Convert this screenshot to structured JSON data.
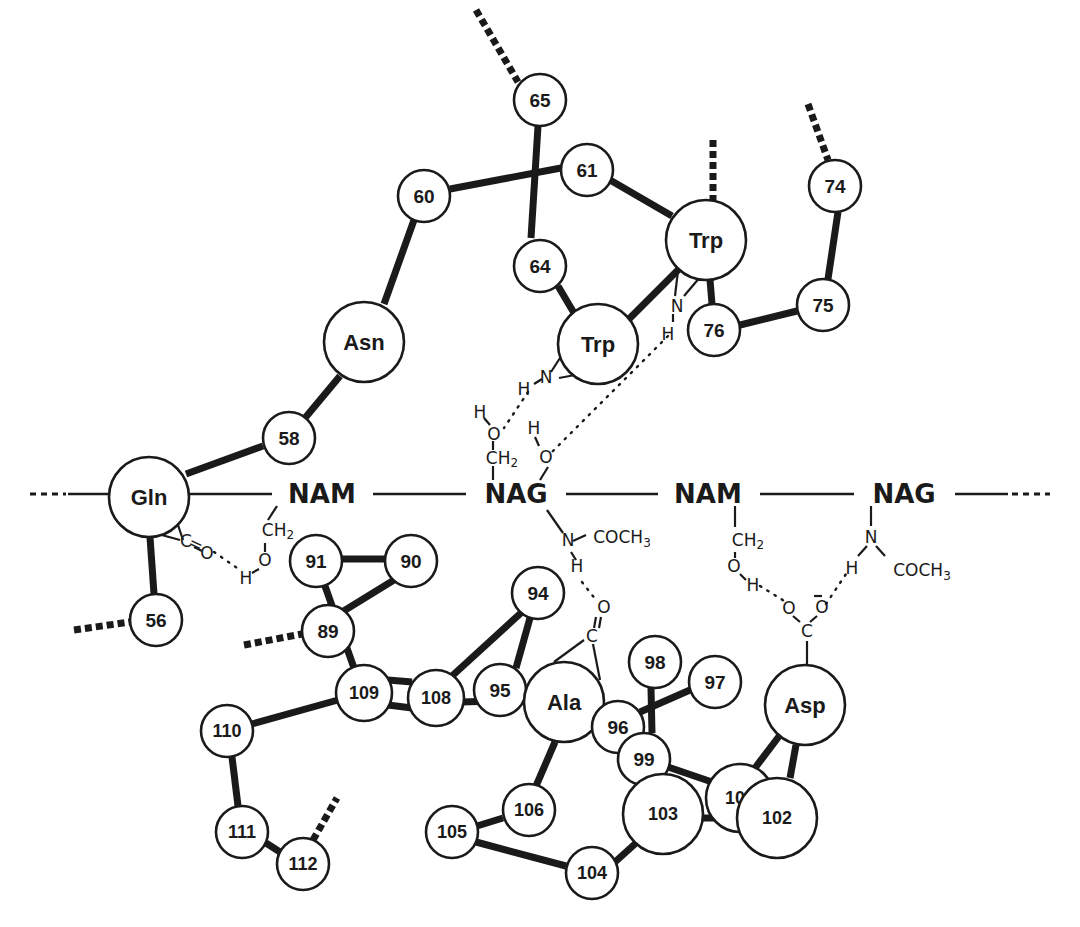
{
  "diagram": {
    "colors": {
      "ink": "#1a1a1a",
      "background": "#ffffff"
    },
    "backbone_chain": {
      "sugars": [
        {
          "id": "nam1",
          "label": "NAM",
          "x": 322,
          "y": 494
        },
        {
          "id": "nag1",
          "label": "NAG",
          "x": 516,
          "y": 494
        },
        {
          "id": "nam2",
          "label": "NAM",
          "x": 708,
          "y": 494
        },
        {
          "id": "nag2",
          "label": "NAG",
          "x": 904,
          "y": 494
        }
      ],
      "left_continuation": "...",
      "right_continuation": "..."
    },
    "residues": [
      {
        "id": "r65",
        "label": "65",
        "x": 540,
        "y": 100,
        "r": 26
      },
      {
        "id": "r61",
        "label": "61",
        "x": 587,
        "y": 170,
        "r": 26
      },
      {
        "id": "r60",
        "label": "60",
        "x": 424,
        "y": 196,
        "r": 26
      },
      {
        "id": "r64",
        "label": "64",
        "x": 540,
        "y": 266,
        "r": 26
      },
      {
        "id": "trp63",
        "label": "Trp",
        "x": 706,
        "y": 240,
        "r": 40
      },
      {
        "id": "trp62",
        "label": "Trp",
        "x": 598,
        "y": 344,
        "r": 40
      },
      {
        "id": "r76",
        "label": "76",
        "x": 714,
        "y": 330,
        "r": 26
      },
      {
        "id": "r75",
        "label": "75",
        "x": 823,
        "y": 305,
        "r": 26
      },
      {
        "id": "r74",
        "label": "74",
        "x": 835,
        "y": 186,
        "r": 26
      },
      {
        "id": "asn59",
        "label": "Asn",
        "x": 364,
        "y": 342,
        "r": 40
      },
      {
        "id": "r58",
        "label": "58",
        "x": 289,
        "y": 438,
        "r": 26
      },
      {
        "id": "gln57",
        "label": "Gln",
        "x": 149,
        "y": 497,
        "r": 40
      },
      {
        "id": "r56",
        "label": "56",
        "x": 156,
        "y": 620,
        "r": 26
      },
      {
        "id": "r91",
        "label": "91",
        "x": 316,
        "y": 561,
        "r": 26
      },
      {
        "id": "r90",
        "label": "90",
        "x": 411,
        "y": 561,
        "r": 26
      },
      {
        "id": "r89",
        "label": "89",
        "x": 328,
        "y": 631,
        "r": 26
      },
      {
        "id": "r109",
        "label": "109",
        "x": 364,
        "y": 693,
        "r": 28
      },
      {
        "id": "r108",
        "label": "108",
        "x": 436,
        "y": 698,
        "r": 28
      },
      {
        "id": "r95",
        "label": "95",
        "x": 500,
        "y": 690,
        "r": 26
      },
      {
        "id": "r94",
        "label": "94",
        "x": 538,
        "y": 593,
        "r": 26
      },
      {
        "id": "ala107",
        "label": "Ala",
        "x": 564,
        "y": 702,
        "r": 40
      },
      {
        "id": "r96",
        "label": "96",
        "x": 618,
        "y": 727,
        "r": 26
      },
      {
        "id": "r98",
        "label": "98",
        "x": 655,
        "y": 662,
        "r": 26
      },
      {
        "id": "r97",
        "label": "97",
        "x": 715,
        "y": 682,
        "r": 26
      },
      {
        "id": "r99",
        "label": "99",
        "x": 644,
        "y": 759,
        "r": 26
      },
      {
        "id": "asp52",
        "label": "Asp",
        "x": 805,
        "y": 705,
        "r": 40
      },
      {
        "id": "r100",
        "label": "100",
        "x": 740,
        "y": 798,
        "r": 34
      },
      {
        "id": "r103",
        "label": "103",
        "x": 663,
        "y": 814,
        "r": 40
      },
      {
        "id": "r102",
        "label": "102",
        "x": 777,
        "y": 818,
        "r": 40
      },
      {
        "id": "r110",
        "label": "110",
        "x": 227,
        "y": 731,
        "r": 26
      },
      {
        "id": "r111",
        "label": "111",
        "x": 242,
        "y": 832,
        "r": 26
      },
      {
        "id": "r112",
        "label": "112",
        "x": 303,
        "y": 864,
        "r": 26
      },
      {
        "id": "r105",
        "label": "105",
        "x": 452,
        "y": 832,
        "r": 26
      },
      {
        "id": "r106",
        "label": "106",
        "x": 529,
        "y": 810,
        "r": 26
      },
      {
        "id": "r104",
        "label": "104",
        "x": 592,
        "y": 873,
        "r": 26
      }
    ],
    "annotations": {
      "trp62_nh": {
        "N": "N",
        "H": "H"
      },
      "trp63_nh": {
        "N": "N",
        "H": "H"
      },
      "nag1_ch2oh": {
        "H": "H",
        "O": "O",
        "CH": "CH",
        "sub": "2"
      },
      "nag1_oh": {
        "H": "H",
        "O": "O"
      },
      "nag1_ncoch3": {
        "N": "N",
        "group": "COCH",
        "sub": "3",
        "H": "H"
      },
      "nam1_ch2oh": {
        "CH": "CH",
        "sub": "2",
        "O": "O",
        "H": "H"
      },
      "gln_co": {
        "C": "C",
        "eq": "=",
        "O": "O"
      },
      "ala_co": {
        "C": "C",
        "O": "O"
      },
      "nam2_ch2oh": {
        "CH": "CH",
        "sub": "2",
        "O": "O",
        "H": "H"
      },
      "nag2_ncoch3": {
        "N": "N",
        "H": "H",
        "group": "COCH",
        "sub": "3"
      },
      "asp_coo": {
        "O1": "O",
        "O2": "O",
        "C": "C",
        "charge": "–"
      }
    }
  }
}
